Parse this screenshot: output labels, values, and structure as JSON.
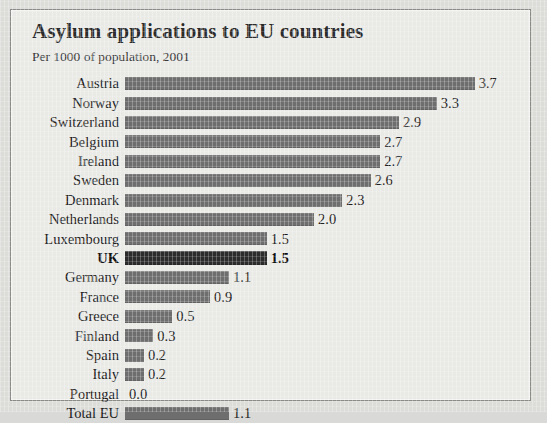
{
  "chart_data": {
    "type": "bar",
    "orientation": "horizontal",
    "title": "Asylum applications to EU countries",
    "subtitle": "Per 1000 of population, 2001",
    "xlabel": "",
    "ylabel": "",
    "xlim": [
      0,
      3.7
    ],
    "grid": false,
    "legend": "none",
    "value_format": "0.0",
    "highlight_category": "UK",
    "bar_color": "#6e6e6e",
    "highlight_bar_color": "#2c2c2c",
    "background_color": "#e9e9e6",
    "categories": [
      "Austria",
      "Norway",
      "Switzerland",
      "Belgium",
      "Ireland",
      "Sweden",
      "Denmark",
      "Netherlands",
      "Luxembourg",
      "UK",
      "Germany",
      "France",
      "Greece",
      "Finland",
      "Spain",
      "Italy",
      "Portugal",
      "Total EU"
    ],
    "values": [
      3.7,
      3.3,
      2.9,
      2.7,
      2.7,
      2.6,
      2.3,
      2.0,
      1.5,
      1.5,
      1.1,
      0.9,
      0.5,
      0.3,
      0.2,
      0.2,
      0.0,
      1.1
    ],
    "value_labels": [
      "3.7",
      "3.3",
      "2.9",
      "2.7",
      "2.7",
      "2.6",
      "2.3",
      "2.0",
      "1.5",
      "1.5",
      "1.1",
      "0.9",
      "0.5",
      "0.3",
      "0.2",
      "0.2",
      "0.0",
      "1.1"
    ],
    "rows": [
      {
        "label": "Austria",
        "value": 3.7,
        "value_label": "3.7",
        "highlight": false
      },
      {
        "label": "Norway",
        "value": 3.3,
        "value_label": "3.3",
        "highlight": false
      },
      {
        "label": "Switzerland",
        "value": 2.9,
        "value_label": "2.9",
        "highlight": false
      },
      {
        "label": "Belgium",
        "value": 2.7,
        "value_label": "2.7",
        "highlight": false
      },
      {
        "label": "Ireland",
        "value": 2.7,
        "value_label": "2.7",
        "highlight": false
      },
      {
        "label": "Sweden",
        "value": 2.6,
        "value_label": "2.6",
        "highlight": false
      },
      {
        "label": "Denmark",
        "value": 2.3,
        "value_label": "2.3",
        "highlight": false
      },
      {
        "label": "Netherlands",
        "value": 2.0,
        "value_label": "2.0",
        "highlight": false
      },
      {
        "label": "Luxembourg",
        "value": 1.5,
        "value_label": "1.5",
        "highlight": false
      },
      {
        "label": "UK",
        "value": 1.5,
        "value_label": "1.5",
        "highlight": true
      },
      {
        "label": "Germany",
        "value": 1.1,
        "value_label": "1.1",
        "highlight": false
      },
      {
        "label": "France",
        "value": 0.9,
        "value_label": "0.9",
        "highlight": false
      },
      {
        "label": "Greece",
        "value": 0.5,
        "value_label": "0.5",
        "highlight": false
      },
      {
        "label": "Finland",
        "value": 0.3,
        "value_label": "0.3",
        "highlight": false
      },
      {
        "label": "Spain",
        "value": 0.2,
        "value_label": "0.2",
        "highlight": false
      },
      {
        "label": "Italy",
        "value": 0.2,
        "value_label": "0.2",
        "highlight": false
      },
      {
        "label": "Portugal",
        "value": 0.0,
        "value_label": "0.0",
        "highlight": false
      },
      {
        "label": "Total EU",
        "value": 1.1,
        "value_label": "1.1",
        "highlight": false
      }
    ]
  }
}
